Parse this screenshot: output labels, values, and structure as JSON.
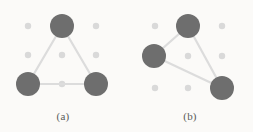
{
  "figure": {
    "background_color": "#fbfaf8",
    "width": 253,
    "height": 132
  },
  "style": {
    "node_color": "#6e6e6e",
    "grid_dot_color": "#d9d9d9",
    "edge_color": "#dcdcdc",
    "caption_color": "#5a5a5a",
    "node_radius": 12,
    "grid_dot_radius": 3.2,
    "edge_width": 2.2
  },
  "panels": [
    {
      "id": "a",
      "caption": "(a)",
      "grid": {
        "columns_x": [
          28,
          62,
          96
        ],
        "rows_y": [
          26,
          55,
          84
        ],
        "dots": [
          {
            "x": 28,
            "y": 26
          },
          {
            "x": 62,
            "y": 26
          },
          {
            "x": 96,
            "y": 26
          },
          {
            "x": 28,
            "y": 55
          },
          {
            "x": 62,
            "y": 55
          },
          {
            "x": 96,
            "y": 55
          },
          {
            "x": 28,
            "y": 84
          },
          {
            "x": 62,
            "y": 84
          },
          {
            "x": 96,
            "y": 84
          }
        ]
      },
      "nodes": [
        {
          "id": "a-top",
          "x": 62,
          "y": 26
        },
        {
          "id": "a-bottom-left",
          "x": 28,
          "y": 84
        },
        {
          "id": "a-bottom-right",
          "x": 96,
          "y": 84
        }
      ],
      "edges": [
        {
          "from": "a-top",
          "to": "a-bottom-left",
          "x1": 62,
          "y1": 26,
          "x2": 28,
          "y2": 84
        },
        {
          "from": "a-top",
          "to": "a-bottom-right",
          "x1": 62,
          "y1": 26,
          "x2": 96,
          "y2": 84
        },
        {
          "from": "a-bottom-left",
          "to": "a-bottom-right",
          "x1": 28,
          "y1": 84,
          "x2": 96,
          "y2": 84
        }
      ]
    },
    {
      "id": "b",
      "caption": "(b)",
      "grid": {
        "columns_x": [
          28,
          61,
          95
        ],
        "rows_y": [
          26,
          56,
          88
        ],
        "dots": [
          {
            "x": 28,
            "y": 26
          },
          {
            "x": 61,
            "y": 26
          },
          {
            "x": 95,
            "y": 26
          },
          {
            "x": 28,
            "y": 56
          },
          {
            "x": 61,
            "y": 56
          },
          {
            "x": 95,
            "y": 56
          },
          {
            "x": 28,
            "y": 88
          },
          {
            "x": 61,
            "y": 88
          },
          {
            "x": 95,
            "y": 88
          }
        ]
      },
      "nodes": [
        {
          "id": "b-top",
          "x": 61,
          "y": 26
        },
        {
          "id": "b-middle-left",
          "x": 27,
          "y": 56
        },
        {
          "id": "b-bottom-right",
          "x": 95,
          "y": 88
        }
      ],
      "edges": [
        {
          "from": "b-top",
          "to": "b-middle-left",
          "x1": 61,
          "y1": 26,
          "x2": 27,
          "y2": 56
        },
        {
          "from": "b-top",
          "to": "b-bottom-right",
          "x1": 61,
          "y1": 26,
          "x2": 95,
          "y2": 88
        },
        {
          "from": "b-middle-left",
          "to": "b-bottom-right",
          "x1": 27,
          "y1": 56,
          "x2": 95,
          "y2": 88
        }
      ]
    }
  ]
}
